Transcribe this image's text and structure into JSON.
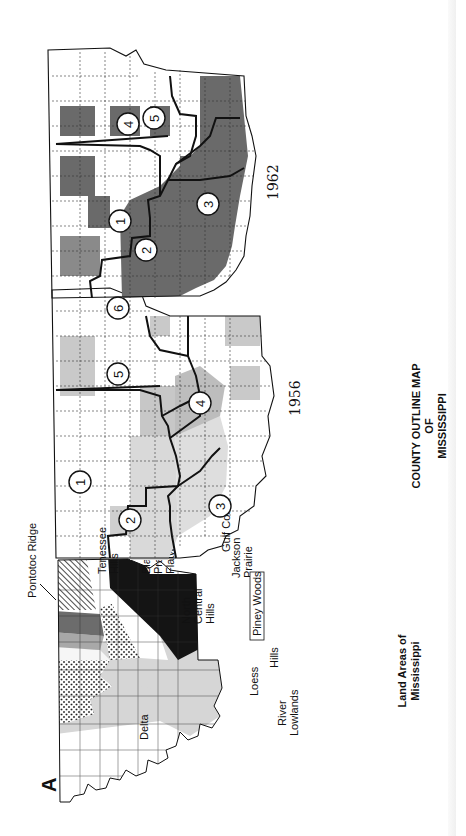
{
  "figure": {
    "panel_letter": "A",
    "orientation": "rotated 90deg counter-clockwise"
  },
  "land_areas_map": {
    "caption_line1": "Land Areas of",
    "caption_line2": "Mississippi",
    "regions": [
      {
        "name": "Pontotoc Ridge",
        "fill": "#f4f4f4"
      },
      {
        "name": "Tenessee Hills",
        "fill": "hatched"
      },
      {
        "name": "Black Prairie",
        "fill": "#6e6e6e"
      },
      {
        "name": "Flatwoods",
        "fill": "#a8a8a8"
      },
      {
        "name": "North Central Hills",
        "fill": "dotted"
      },
      {
        "name": "Jackson Prairie",
        "fill": "#ffffff"
      },
      {
        "name": "Delta",
        "fill": "#ffffff"
      },
      {
        "name": "Loess Hills",
        "fill": "#d8d8d8"
      },
      {
        "name": "River Lowlands",
        "fill": "#ffffff"
      },
      {
        "name": "Piney Woods",
        "fill": "#151515"
      },
      {
        "name": "Gulf Coast",
        "fill": "#ffffff"
      }
    ],
    "labels": {
      "pontotoc": "Pontotoc Ridge",
      "tennessee_1": "Tenessee",
      "tennessee_2": "Hills",
      "black_1": "Black",
      "black_2": "Prairie",
      "flatwoods": "Flatwoods",
      "north_1": "North",
      "north_2": "Central",
      "north_3": "Hills",
      "jackson_1": "Jackson",
      "jackson_2": "Prairie",
      "delta": "Delta",
      "loess": "Loess",
      "hills": "Hills",
      "river_1": "River",
      "river_2": "Lowlands",
      "piney": "Piney Woods",
      "gulf": "Gulf Coast"
    }
  },
  "map_1956": {
    "year": "1956",
    "districts": [
      "1",
      "2",
      "3",
      "4",
      "5",
      "6"
    ],
    "shading": {
      "light": "#d9d9d9",
      "medium": "#c2c2c2"
    }
  },
  "map_1962": {
    "year": "1962",
    "districts": [
      "1",
      "2",
      "3",
      "4",
      "5"
    ],
    "shading": {
      "dark": "#6a6a6a"
    }
  },
  "shared_caption": {
    "line1": "COUNTY OUTLINE MAP",
    "line2": "OF",
    "line3": "MISSISSIPPI"
  }
}
